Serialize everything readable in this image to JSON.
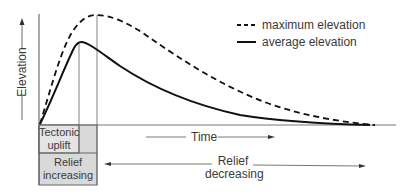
{
  "diagram": {
    "yaxis_label": "Elevation",
    "xaxis_label": "Time",
    "legend": [
      {
        "label": "maximum elevation",
        "style": "dashed"
      },
      {
        "label": "average elevation",
        "style": "solid"
      }
    ],
    "phases": {
      "uplift": {
        "line1": "Tectonic",
        "line2": "uplift"
      },
      "relief_increasing": {
        "line1": "Relief",
        "line2": "increasing"
      },
      "relief_decreasing": {
        "line1": "Relief",
        "line2": "decreasing"
      }
    },
    "colors": {
      "box_fill": "#d9d9d9",
      "curve": "#111111",
      "axis": "#555555"
    }
  }
}
